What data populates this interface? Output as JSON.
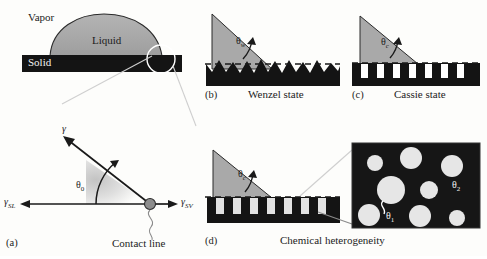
{
  "figure": {
    "panels": [
      {
        "letter": "(a)",
        "caption": "Contact line"
      },
      {
        "letter": "(b)",
        "caption": "Wenzel state"
      },
      {
        "letter": "(c)",
        "caption": "Cassie state"
      },
      {
        "letter": "(d)",
        "caption": "Chemical heterogeneity"
      }
    ]
  },
  "drop_panel": {
    "vapor_label": "Vapor",
    "liquid_label": "Liquid",
    "solid_label": "Solid"
  },
  "panel_a": {
    "letter": "(a)",
    "gamma_label": "γ",
    "gamma_sl_label": "γ",
    "gamma_sl_sub": "SL",
    "gamma_sv_label": "γ",
    "gamma_sv_sub": "SV",
    "theta_label": "θ",
    "theta_sub": "0",
    "contact_line_label": "Contact line"
  },
  "panel_b": {
    "letter": "(b)",
    "caption": "Wenzel state",
    "theta_label": "θ",
    "theta_sub": "w"
  },
  "panel_c": {
    "letter": "(c)",
    "caption": "Cassie state",
    "theta_label": "θ",
    "theta_sub": "c"
  },
  "panel_d": {
    "letter": "(d)",
    "caption": "Chemical heterogeneity",
    "theta_label": "θ",
    "theta_sub": "c"
  },
  "inset": {
    "theta1_label": "θ",
    "theta1_sub": "1",
    "theta2_label": "θ",
    "theta2_sub": "2"
  },
  "colors": {
    "solid_dark": "#141414",
    "liquid_gray": "#a9a9a9",
    "patch_light": "#e2e2e2",
    "background": "#fdfdfb",
    "line": "#1a1a1a"
  }
}
